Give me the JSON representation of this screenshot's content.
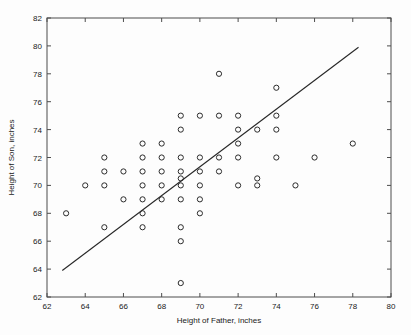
{
  "chart_data": {
    "type": "scatter",
    "title": "",
    "xlabel": "Height of Father, inches",
    "ylabel": "Height of Son, inches",
    "xlim": [
      62,
      80
    ],
    "ylim": [
      62,
      82
    ],
    "xticks": [
      62,
      64,
      66,
      68,
      70,
      72,
      74,
      76,
      78,
      80
    ],
    "yticks": [
      62,
      64,
      66,
      68,
      70,
      72,
      74,
      76,
      78,
      80,
      82
    ],
    "grid": false,
    "legend": null,
    "marker": "open-circle",
    "marker_color": "#2b2b2b",
    "points": [
      {
        "x": 63,
        "y": 68
      },
      {
        "x": 64,
        "y": 70
      },
      {
        "x": 65,
        "y": 72
      },
      {
        "x": 65,
        "y": 71
      },
      {
        "x": 65,
        "y": 70
      },
      {
        "x": 65,
        "y": 67
      },
      {
        "x": 66,
        "y": 71
      },
      {
        "x": 66,
        "y": 69
      },
      {
        "x": 67,
        "y": 73
      },
      {
        "x": 67,
        "y": 72
      },
      {
        "x": 67,
        "y": 71
      },
      {
        "x": 67,
        "y": 70
      },
      {
        "x": 67,
        "y": 69
      },
      {
        "x": 67,
        "y": 68
      },
      {
        "x": 67,
        "y": 67
      },
      {
        "x": 68,
        "y": 73
      },
      {
        "x": 68,
        "y": 72
      },
      {
        "x": 68,
        "y": 71
      },
      {
        "x": 68,
        "y": 70
      },
      {
        "x": 68,
        "y": 69
      },
      {
        "x": 69,
        "y": 75
      },
      {
        "x": 69,
        "y": 74
      },
      {
        "x": 69,
        "y": 72
      },
      {
        "x": 69,
        "y": 71
      },
      {
        "x": 69,
        "y": 70.5
      },
      {
        "x": 69,
        "y": 70
      },
      {
        "x": 69,
        "y": 69
      },
      {
        "x": 69,
        "y": 67
      },
      {
        "x": 69,
        "y": 66
      },
      {
        "x": 69,
        "y": 63
      },
      {
        "x": 70,
        "y": 75
      },
      {
        "x": 70,
        "y": 72
      },
      {
        "x": 70,
        "y": 71
      },
      {
        "x": 70,
        "y": 70
      },
      {
        "x": 70,
        "y": 69
      },
      {
        "x": 70,
        "y": 68
      },
      {
        "x": 71,
        "y": 78
      },
      {
        "x": 71,
        "y": 75
      },
      {
        "x": 71,
        "y": 72
      },
      {
        "x": 71,
        "y": 71
      },
      {
        "x": 72,
        "y": 75
      },
      {
        "x": 72,
        "y": 74
      },
      {
        "x": 72,
        "y": 73
      },
      {
        "x": 72,
        "y": 72
      },
      {
        "x": 72,
        "y": 70
      },
      {
        "x": 73,
        "y": 74
      },
      {
        "x": 73,
        "y": 70.5
      },
      {
        "x": 73,
        "y": 70
      },
      {
        "x": 74,
        "y": 77
      },
      {
        "x": 74,
        "y": 75
      },
      {
        "x": 74,
        "y": 74
      },
      {
        "x": 74,
        "y": 72
      },
      {
        "x": 75,
        "y": 70
      },
      {
        "x": 76,
        "y": 72
      },
      {
        "x": 78,
        "y": 73
      }
    ],
    "fit_line": {
      "label": "regression line",
      "x_start": 62.8,
      "y_start": 63.9,
      "x_end": 78.3,
      "y_end": 79.9,
      "color": "#262626"
    }
  }
}
